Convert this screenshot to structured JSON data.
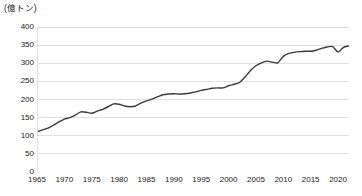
{
  "chart_data": {
    "type": "line",
    "title": "",
    "subtitle": "",
    "unit_label": "(億トン)",
    "xlabel": "",
    "ylabel": "",
    "xlim": [
      1965,
      2022
    ],
    "ylim": [
      0,
      400
    ],
    "grid": true,
    "grid_axis": "y",
    "legend": false,
    "legend_position": "none",
    "line_color": "#3a3a3a",
    "grid_color": "#d9d9d9",
    "axis_color": "#9a9a9a",
    "background_color": "#ffffff",
    "y_ticks": [
      0,
      50,
      100,
      150,
      200,
      250,
      300,
      350,
      400
    ],
    "y_tick_labels": [
      "0",
      "50",
      "100",
      "150",
      "200",
      "250",
      "300",
      "350",
      "400"
    ],
    "x_ticks": [
      1965,
      1970,
      1975,
      1980,
      1985,
      1990,
      1995,
      2000,
      2005,
      2010,
      2015,
      2020
    ],
    "x_tick_labels": [
      "1965",
      "1970",
      "1975",
      "1980",
      "1985",
      "1990",
      "1995",
      "2000",
      "2005",
      "2010",
      "2015",
      "2020"
    ],
    "x_minor_tick_interval": 1,
    "series": [
      {
        "name": "",
        "x": [
          1965,
          1966,
          1967,
          1968,
          1969,
          1970,
          1971,
          1972,
          1973,
          1974,
          1975,
          1976,
          1977,
          1978,
          1979,
          1980,
          1981,
          1982,
          1983,
          1984,
          1985,
          1986,
          1987,
          1988,
          1989,
          1990,
          1991,
          1992,
          1993,
          1994,
          1995,
          1996,
          1997,
          1998,
          1999,
          2000,
          2001,
          2002,
          2003,
          2004,
          2005,
          2006,
          2007,
          2008,
          2009,
          2010,
          2011,
          2012,
          2013,
          2014,
          2015,
          2016,
          2017,
          2018,
          2019,
          2020,
          2021,
          2022
        ],
        "values": [
          111,
          116,
          121,
          129,
          138,
          146,
          150,
          157,
          166,
          165,
          162,
          168,
          173,
          180,
          188,
          187,
          182,
          180,
          182,
          190,
          196,
          201,
          207,
          213,
          215,
          216,
          215,
          216,
          218,
          221,
          225,
          228,
          231,
          232,
          232,
          238,
          242,
          247,
          262,
          280,
          293,
          301,
          306,
          303,
          301,
          319,
          327,
          330,
          332,
          333,
          333,
          336,
          341,
          345,
          346,
          331,
          344,
          348
        ]
      }
    ]
  }
}
